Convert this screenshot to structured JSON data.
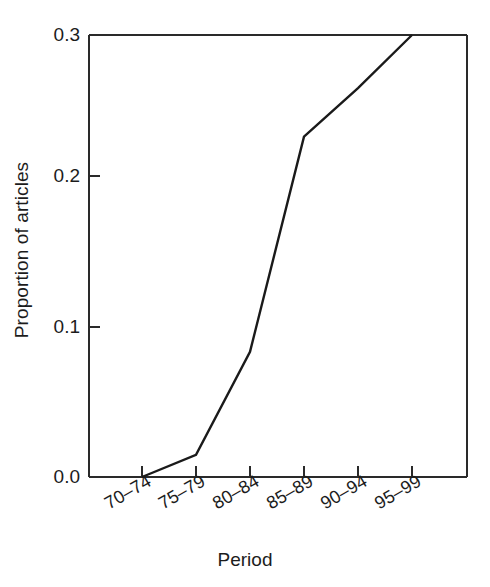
{
  "chart_data": {
    "type": "line",
    "title": "",
    "subtitle": "",
    "xlabel": "Period",
    "ylabel": "Proportion of articles",
    "categories": [
      "70–74",
      "75–79",
      "80–84",
      "85–89",
      "90–94",
      "95–99"
    ],
    "values": [
      0.0,
      0.015,
      0.085,
      0.231,
      0.264,
      0.3
    ],
    "series": [
      {
        "name": "Proportion of articles",
        "values": [
          0.0,
          0.015,
          0.085,
          0.231,
          0.264,
          0.3
        ],
        "color": "#1a1a1a",
        "marker": "none",
        "line_width": 2
      }
    ],
    "ylim": [
      0.0,
      0.3
    ],
    "yticks": [
      0.0,
      0.1,
      0.2,
      0.3
    ],
    "ytick_labels": [
      "0.0",
      "0.1",
      "0.2",
      "0.3"
    ],
    "xtick_labels": [
      "70–74",
      "75–79",
      "80–84",
      "85–89",
      "90–94",
      "95–99"
    ],
    "xtick_rotation_deg": 30,
    "grid": false,
    "legend": false,
    "legend_position": "none",
    "axis_color": "#1a1a1a",
    "background_color": "#ffffff",
    "frame": "box",
    "tick_direction": "in"
  },
  "axes": {
    "y_title": "Proportion of articles",
    "x_title": "Period",
    "y_ticks": [
      {
        "value": 0.3,
        "label": "0.3"
      },
      {
        "value": 0.2,
        "label": "0.2"
      },
      {
        "value": 0.1,
        "label": "0.1"
      },
      {
        "value": 0.0,
        "label": "0.0"
      }
    ],
    "x_ticks": [
      {
        "index": 0,
        "label": "70–74"
      },
      {
        "index": 1,
        "label": "75–79"
      },
      {
        "index": 2,
        "label": "80–84"
      },
      {
        "index": 3,
        "label": "85–89"
      },
      {
        "index": 4,
        "label": "90–94"
      },
      {
        "index": 5,
        "label": "95–99"
      }
    ]
  }
}
